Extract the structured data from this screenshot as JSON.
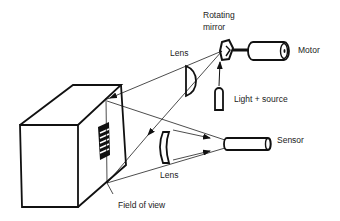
{
  "diagram": {
    "type": "optical scanning system schematic",
    "labels": {
      "rotating_mirror_line1": "Rotating",
      "rotating_mirror_line2": "mirror",
      "motor": "Motor",
      "lens_upper": "Lens",
      "light_source": "Light + source",
      "sensor": "Sensor",
      "lens_lower": "Lens",
      "field_of_view": "Field of view"
    },
    "colors": {
      "line": "#111111",
      "text": "#222222",
      "background": "#ffffff"
    }
  }
}
